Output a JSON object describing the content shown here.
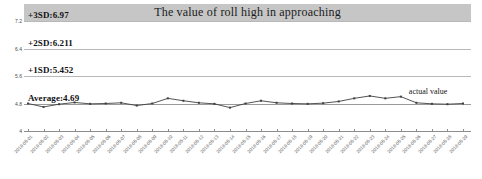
{
  "chart_data": {
    "type": "line",
    "title": "The value of roll high in approaching",
    "xlabel": "",
    "ylabel": "",
    "ylim": [
      4,
      7.2
    ],
    "ytick_labels": [
      "7.2",
      "6.4",
      "5.6",
      "4.8",
      "4"
    ],
    "ytick_values": [
      7.2,
      6.4,
      5.6,
      4.8,
      4
    ],
    "grid": true,
    "legend_position": "inline-annotation",
    "series": [
      {
        "name": "actual value",
        "values": [
          4.8,
          4.7,
          4.78,
          4.83,
          4.79,
          4.8,
          4.82,
          4.74,
          4.8,
          4.95,
          4.88,
          4.82,
          4.79,
          4.68,
          4.8,
          4.88,
          4.82,
          4.8,
          4.79,
          4.81,
          4.86,
          4.95,
          5.02,
          4.95,
          5.0,
          4.82,
          4.79,
          4.78,
          4.8
        ]
      }
    ],
    "categories": [
      "2018-05-01",
      "2018-05-02",
      "2018-05-03",
      "2018-05-04",
      "2018-05-05",
      "2018-05-06",
      "2018-05-07",
      "2018-05-08",
      "2018-05-09",
      "2018-05-10",
      "2018-05-11",
      "2018-05-12",
      "2018-05-13",
      "2018-05-14",
      "2018-05-15",
      "2018-05-16",
      "2018-05-17",
      "2018-05-18",
      "2018-05-19",
      "2018-05-20",
      "2018-05-21",
      "2018-05-22",
      "2018-05-23",
      "2018-05-24",
      "2018-05-25",
      "2018-05-26",
      "2018-05-27",
      "2018-05-28",
      "2018-05-29"
    ],
    "reference_lines": [
      {
        "key": "sd3",
        "label": "+3SD:6.97",
        "value": 6.97
      },
      {
        "key": "sd2",
        "label": "+2SD:6.211",
        "value": 6.211
      },
      {
        "key": "sd1",
        "label": "+1SD:5.452",
        "value": 5.452
      },
      {
        "key": "average",
        "label": "Average:4.69",
        "value": 4.69
      }
    ],
    "annotations": [
      {
        "key": "actual",
        "text": "actual value"
      }
    ],
    "colors": {
      "series_line": "#404040",
      "gridline": "#b8b8b8",
      "average_line": "#9a9a9a",
      "title_band": "#c6c6c6",
      "axis": "#8d8d8d",
      "text": "#121212"
    }
  }
}
